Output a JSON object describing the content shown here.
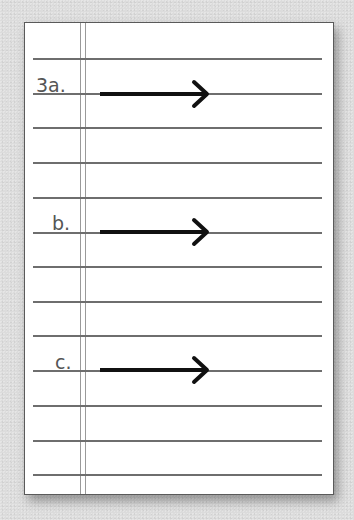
{
  "worksheet": {
    "items": [
      {
        "label": "3a.",
        "arrow": "right-arrow"
      },
      {
        "label": "b.",
        "arrow": "right-arrow"
      },
      {
        "label": "c.",
        "arrow": "right-arrow"
      }
    ],
    "ruled_lines": 13
  },
  "colors": {
    "paper": "#ffffff",
    "background": "#dcdcdc",
    "rule": "#6e6e6e",
    "margin": "#9a9a9a",
    "label": "#555555",
    "arrow": "#111111"
  }
}
